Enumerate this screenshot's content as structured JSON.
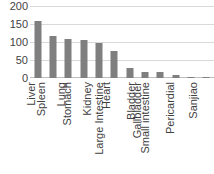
{
  "chart_data": {
    "type": "bar",
    "title": "",
    "subtitle": "",
    "xlabel": "",
    "ylabel": "",
    "categories": [
      "Liver",
      "Spleen",
      "Lung",
      "Stomach",
      "Kidney",
      "Heart",
      "Large Intestine",
      "Bladder",
      "Gallbladder",
      "Small intestine",
      "Pericardial",
      "Sanjiao"
    ],
    "values": [
      158,
      117,
      108,
      105,
      97,
      75,
      27,
      18,
      17,
      8,
      3,
      2
    ],
    "ylim": [
      0,
      200
    ],
    "yticks": [
      0,
      50,
      100,
      150,
      200
    ],
    "ytick_labels": [
      "0",
      "50",
      "100",
      "150",
      "200"
    ],
    "grid": true,
    "legend": "none",
    "bar_color": "#7f7f7f",
    "gridline_color": "#d9d9d9",
    "axis_color": "#bfbfbf",
    "text_color": "#3f3f3f",
    "background": "#ffffff"
  }
}
